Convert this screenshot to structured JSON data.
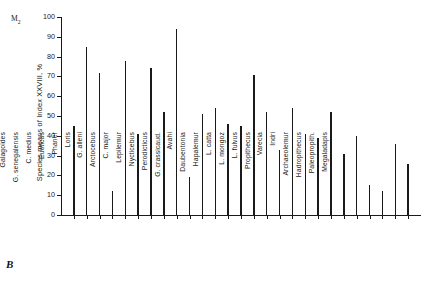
{
  "panel": {
    "letter": "B"
  },
  "annotation": {
    "symbol": "M",
    "subscript": "2"
  },
  "chart_data": {
    "type": "bar",
    "title": "",
    "xlabel": "",
    "ylabel": "Species means of Index XXVIII, %",
    "ylim": [
      0,
      100
    ],
    "ytick_labels": [
      "0",
      "10",
      "20",
      "30",
      "40",
      "50",
      "60",
      "70",
      "80",
      "90",
      "100"
    ],
    "yticks": [
      0,
      10,
      20,
      30,
      40,
      50,
      60,
      70,
      80,
      90,
      100
    ],
    "grid": false,
    "legend": null,
    "categories": [
      "Microcebus",
      "Galagoides",
      "G. senegalensis",
      "C. medius",
      "Euoticus",
      "Phaner",
      "Loris",
      "G. alleni",
      "Arctocebus",
      "C. major",
      "Lepilemur",
      "Nycticebus",
      "Perodicticus",
      "G. crassicaud.",
      "Avahi",
      "Daubentonia",
      "Hapalemur",
      "L. catta",
      "L. mongoz",
      "L. fulvus",
      "Propithecus",
      "Varecia",
      "Indri",
      "Archaeolemur",
      "Hadropithecus",
      "Paleopropith.",
      "Megaladapis"
    ],
    "values": [
      45,
      85,
      71.5,
      12,
      78,
      41,
      74,
      52,
      94,
      19,
      51,
      54,
      46,
      45,
      70.5,
      52,
      33,
      54,
      41,
      39,
      52,
      31,
      40,
      15,
      12,
      36,
      26
    ]
  }
}
